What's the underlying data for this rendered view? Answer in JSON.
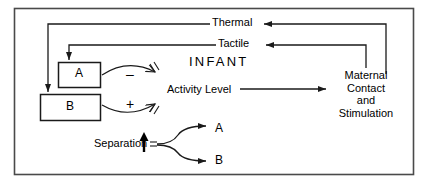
{
  "diagram": {
    "title": "INFANT",
    "border": {
      "color": "#4a4a4a"
    },
    "stroke_color": "#1a1a1a",
    "background": "#ffffff",
    "boxes": [
      {
        "id": "a",
        "label": "A"
      },
      {
        "id": "b",
        "label": "B"
      }
    ],
    "pathways": [
      {
        "id": "thermal",
        "label": "Thermal"
      },
      {
        "id": "tactile",
        "label": "Tactile"
      }
    ],
    "signs": {
      "negative": "–",
      "positive": "+"
    },
    "activity": {
      "label": "Activity Level"
    },
    "maternal": {
      "label": "Maternal\nContact\nand\nStimulation"
    },
    "separation": {
      "label": "Separation",
      "direction_icon": "up-arrow-icon",
      "outcomes": [
        {
          "id": "a",
          "label": "A"
        },
        {
          "id": "b",
          "label": "B"
        }
      ]
    }
  }
}
